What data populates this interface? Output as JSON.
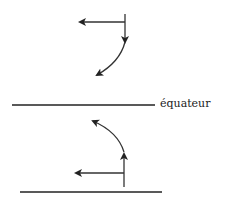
{
  "diagram": {
    "equator_label": "équateur",
    "stroke_color": "#333333",
    "line_color": "#222222"
  }
}
